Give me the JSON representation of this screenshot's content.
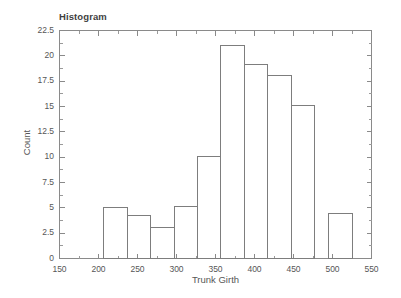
{
  "chart_data": {
    "type": "bar",
    "title": "Histogram",
    "xlabel": "Trunk Girth",
    "ylabel": "Count",
    "xlim": [
      150,
      550
    ],
    "ylim": [
      0,
      22.5
    ],
    "grid": false,
    "legend": null,
    "bin_width": 30,
    "bin_edges": [
      207,
      237,
      267,
      297,
      327,
      357,
      387,
      417,
      447,
      477,
      507
    ],
    "categories": [
      "207-237",
      "237-267",
      "267-297",
      "297-327",
      "327-357",
      "357-387",
      "387-417",
      "417-447",
      "447-477",
      "495-525"
    ],
    "values": [
      5.0,
      4.2,
      3.1,
      5.1,
      10.1,
      21.0,
      19.1,
      18.1,
      15.1,
      4.4
    ],
    "bars": [
      {
        "x0": 207,
        "x1": 237,
        "count": 5.0
      },
      {
        "x0": 237,
        "x1": 267,
        "count": 4.2
      },
      {
        "x0": 267,
        "x1": 297,
        "count": 3.1
      },
      {
        "x0": 297,
        "x1": 327,
        "count": 5.1
      },
      {
        "x0": 327,
        "x1": 357,
        "count": 10.1
      },
      {
        "x0": 357,
        "x1": 387,
        "count": 21.0
      },
      {
        "x0": 387,
        "x1": 417,
        "count": 19.1
      },
      {
        "x0": 417,
        "x1": 447,
        "count": 18.1
      },
      {
        "x0": 447,
        "x1": 477,
        "count": 15.1
      },
      {
        "x0": 495,
        "x1": 525,
        "count": 4.4
      }
    ],
    "xticks": [
      150,
      200,
      250,
      300,
      350,
      400,
      450,
      500,
      550
    ],
    "xtick_labels": [
      "150",
      "200",
      "250",
      "300",
      "350",
      "400",
      "450",
      "500",
      "550"
    ],
    "yticks": [
      0,
      2.5,
      5,
      7.5,
      10,
      12.5,
      15,
      17.5,
      20,
      22.5
    ],
    "ytick_labels": [
      "0",
      "2.5",
      "5",
      "7.5",
      "10",
      "12.5",
      "15",
      "17.5",
      "20",
      "22.5"
    ],
    "colors": {
      "background": "#ffffff",
      "axis": "#8a8a8a",
      "bar_stroke": "#7d7d7d",
      "text": "#565656",
      "title_text": "#3f3f3f"
    }
  }
}
